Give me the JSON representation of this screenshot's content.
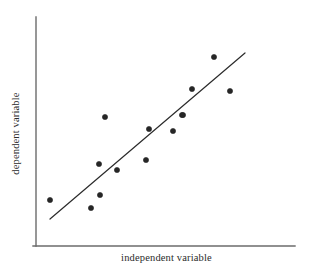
{
  "figure": {
    "width": 311,
    "height": 268,
    "background": "#ffffff",
    "ink_color": "#2b2b2b",
    "point_color": "#262626",
    "axis_color": "#6b6b6b"
  },
  "chart_data": {
    "type": "scatter",
    "title": "",
    "xlabel": "independent variable",
    "ylabel": "dependent variable",
    "xlim": [
      0,
      100
    ],
    "ylim": [
      0,
      100
    ],
    "grid": false,
    "legend": null,
    "axis_ticks": {
      "x": [],
      "y": []
    },
    "marker": {
      "shape": "circle",
      "filled": true,
      "radius_px": 2.6,
      "color": "#262626"
    },
    "points": [
      {
        "x": 6.5,
        "y": 20.1,
        "px": 50,
        "py": 200
      },
      {
        "x": 22.1,
        "y": 16.7,
        "px": 91,
        "py": 208
      },
      {
        "x": 25.6,
        "y": 22.2,
        "px": 100,
        "py": 195
      },
      {
        "x": 27.5,
        "y": 57.7,
        "px": 105,
        "py": 117
      },
      {
        "x": 25.2,
        "y": 35.9,
        "px": 99,
        "py": 164
      },
      {
        "x": 32.1,
        "y": 33.3,
        "px": 117,
        "py": 170
      },
      {
        "x": 43.1,
        "y": 37.6,
        "px": 146,
        "py": 160
      },
      {
        "x": 44.3,
        "y": 50.9,
        "px": 149,
        "py": 129
      },
      {
        "x": 52.3,
        "y": 50.0,
        "px": 173,
        "py": 131
      },
      {
        "x": 55.7,
        "y": 56.8,
        "px": 182,
        "py": 115
      },
      {
        "x": 56.1,
        "y": 56.8,
        "px": 183,
        "py": 115
      },
      {
        "x": 59.5,
        "y": 67.1,
        "px": 192,
        "py": 89
      },
      {
        "x": 67.9,
        "y": 80.8,
        "px": 214,
        "py": 57
      },
      {
        "x": 74.0,
        "y": 66.2,
        "px": 230,
        "py": 91
      }
    ],
    "trendline": {
      "visible": true,
      "style": "solid",
      "color": "#2b2b2b",
      "width_px": 1.2,
      "start": {
        "px": 50,
        "py": 219
      },
      "end": {
        "px": 245,
        "py": 53
      }
    },
    "axes_geometry": {
      "y_axis": {
        "x": 36,
        "y_top": 17,
        "y_bottom": 246
      },
      "x_axis": {
        "y": 246,
        "x_left": 33,
        "x_right": 295
      }
    }
  }
}
